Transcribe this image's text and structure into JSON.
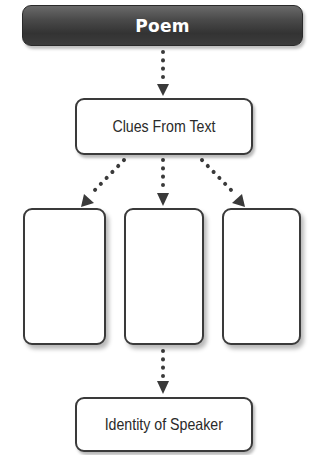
{
  "diagram": {
    "title_node": {
      "label": "Poem"
    },
    "clues_node": {
      "label": "Clues From Text"
    },
    "clue_boxes": [
      {
        "label": ""
      },
      {
        "label": ""
      },
      {
        "label": ""
      }
    ],
    "result_node": {
      "label": "Identity of Speaker"
    },
    "edges": [
      {
        "from": "Poem",
        "to": "Clues From Text",
        "style": "dotted-arrow"
      },
      {
        "from": "Clues From Text",
        "to": "clue_box_1",
        "style": "dotted-arrow"
      },
      {
        "from": "Clues From Text",
        "to": "clue_box_2",
        "style": "dotted-arrow"
      },
      {
        "from": "Clues From Text",
        "to": "clue_box_3",
        "style": "dotted-arrow"
      },
      {
        "from": "clue_box_2",
        "to": "Identity of Speaker",
        "style": "dotted-arrow"
      }
    ],
    "colors": {
      "title_fill": "#4a4a4a",
      "title_text": "#ffffff",
      "box_border": "#3a3a3a",
      "connector": "#3a3a3a"
    }
  }
}
